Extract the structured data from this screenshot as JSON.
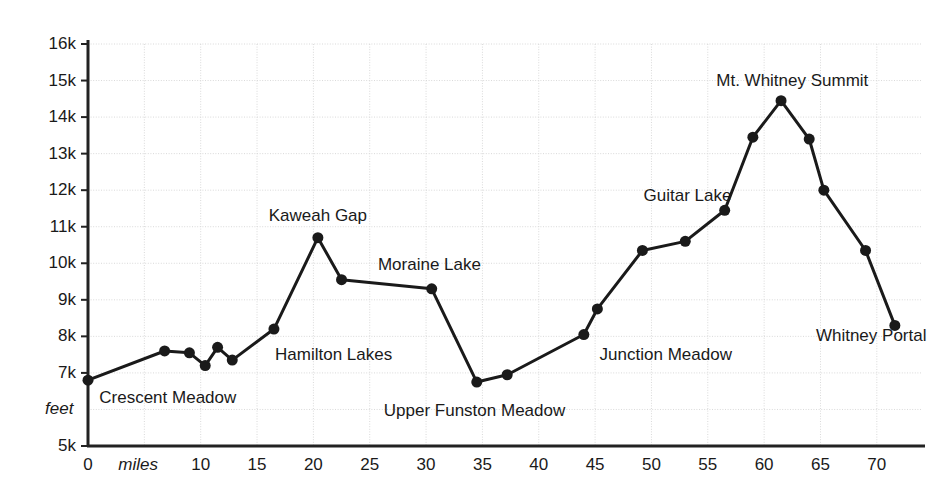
{
  "chart_data": {
    "type": "line",
    "title": "",
    "subtitle": "",
    "xlabel": "miles",
    "ylabel": "feet",
    "xlim": [
      0,
      72.5
    ],
    "ylim": [
      5000,
      16000
    ],
    "grid": true,
    "legend": null,
    "x_ticks": [
      {
        "value": 0,
        "label": "0"
      },
      {
        "value": 5,
        "label": ""
      },
      {
        "value": 10,
        "label": "10"
      },
      {
        "value": 15,
        "label": "15"
      },
      {
        "value": 20,
        "label": "20"
      },
      {
        "value": 25,
        "label": "25"
      },
      {
        "value": 30,
        "label": "30"
      },
      {
        "value": 35,
        "label": "35"
      },
      {
        "value": 40,
        "label": "40"
      },
      {
        "value": 45,
        "label": "45"
      },
      {
        "value": 50,
        "label": "50"
      },
      {
        "value": 55,
        "label": "55"
      },
      {
        "value": 60,
        "label": "60"
      },
      {
        "value": 65,
        "label": "65"
      },
      {
        "value": 70,
        "label": "70"
      }
    ],
    "y_ticks": [
      {
        "value": 5000,
        "label": "5k"
      },
      {
        "value": 6000,
        "label": ""
      },
      {
        "value": 7000,
        "label": "7k"
      },
      {
        "value": 8000,
        "label": "8k"
      },
      {
        "value": 9000,
        "label": "9k"
      },
      {
        "value": 10000,
        "label": "10k"
      },
      {
        "value": 11000,
        "label": "11k"
      },
      {
        "value": 12000,
        "label": "12k"
      },
      {
        "value": 13000,
        "label": "13k"
      },
      {
        "value": 14000,
        "label": "14k"
      },
      {
        "value": 15000,
        "label": "15k"
      },
      {
        "value": 16000,
        "label": "16k"
      }
    ],
    "series": [
      {
        "name": "High Sierra Trail elevation profile",
        "color": "#1a1a1a",
        "points": [
          {
            "x": 0.0,
            "y": 6800
          },
          {
            "x": 6.8,
            "y": 7600
          },
          {
            "x": 9.0,
            "y": 7550
          },
          {
            "x": 10.4,
            "y": 7200
          },
          {
            "x": 11.5,
            "y": 7700
          },
          {
            "x": 12.8,
            "y": 7350
          },
          {
            "x": 16.5,
            "y": 8200
          },
          {
            "x": 20.4,
            "y": 10700
          },
          {
            "x": 22.5,
            "y": 9550
          },
          {
            "x": 30.5,
            "y": 9300
          },
          {
            "x": 34.5,
            "y": 6750
          },
          {
            "x": 37.2,
            "y": 6950
          },
          {
            "x": 44.0,
            "y": 8050
          },
          {
            "x": 45.2,
            "y": 8750
          },
          {
            "x": 49.2,
            "y": 10350
          },
          {
            "x": 53.0,
            "y": 10600
          },
          {
            "x": 56.5,
            "y": 11450
          },
          {
            "x": 59.0,
            "y": 13450
          },
          {
            "x": 61.5,
            "y": 14450
          },
          {
            "x": 64.0,
            "y": 13400
          },
          {
            "x": 65.3,
            "y": 12000
          },
          {
            "x": 69.0,
            "y": 10350
          },
          {
            "x": 71.6,
            "y": 8300
          }
        ]
      }
    ],
    "annotations": [
      {
        "text": "Crescent Meadow",
        "x": 1.0,
        "y": 6300,
        "align": "left"
      },
      {
        "text": "Hamilton Lakes",
        "x": 16.6,
        "y": 7500,
        "align": "left"
      },
      {
        "text": "Kaweah Gap",
        "x": 20.4,
        "y": 11300,
        "align": "center"
      },
      {
        "text": "Moraine Lake",
        "x": 30.3,
        "y": 9950,
        "align": "center"
      },
      {
        "text": "Upper Funston Meadow",
        "x": 34.3,
        "y": 5950,
        "align": "center"
      },
      {
        "text": "Junction Meadow",
        "x": 45.4,
        "y": 7500,
        "align": "left"
      },
      {
        "text": "Guitar Lake",
        "x": 53.2,
        "y": 11850,
        "align": "center"
      },
      {
        "text": "Mt. Whitney Summit",
        "x": 62.5,
        "y": 15000,
        "align": "center"
      },
      {
        "text": "Whitney Portal",
        "x": 69.5,
        "y": 8000,
        "align": "center"
      }
    ]
  }
}
